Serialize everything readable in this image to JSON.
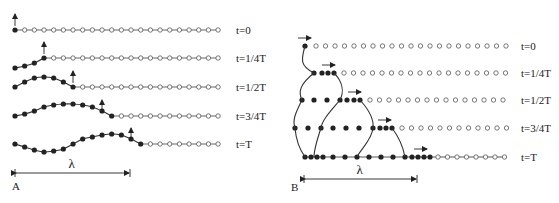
{
  "figure": {
    "panel_a": {
      "label": "A",
      "description": "Transverse wave propagation along a chain of particles",
      "n_points": 22,
      "x_start": 15,
      "spacing": 9.67,
      "rows": [
        {
          "time_label": "t=0",
          "y": 30,
          "displaced": [
            0
          ],
          "arrow_index": 0
        },
        {
          "time_label": "t=1/4T",
          "y": 58,
          "displaced": [
            -10,
            -8,
            -5,
            0
          ],
          "arrow_index": 3
        },
        {
          "time_label": "t=1/2T",
          "y": 87,
          "displaced": [
            0,
            5,
            9,
            10,
            9,
            5,
            0
          ],
          "arrow_index": 6
        },
        {
          "time_label": "t=3/4T",
          "y": 116,
          "displaced": [
            0,
            2,
            5,
            9,
            11,
            12,
            12,
            11,
            9,
            5,
            0
          ],
          "arrow_index": 9
        },
        {
          "time_label": "t=T",
          "y": 144,
          "displaced": [
            0,
            -3,
            -6,
            -8,
            -7,
            -5,
            0,
            5,
            7,
            9,
            10,
            9,
            5,
            0
          ],
          "arrow_index": 12
        }
      ],
      "wavelength_label": "λ",
      "wavelength_bar": {
        "x1": 15,
        "x2": 130,
        "y": 173
      }
    },
    "panel_b": {
      "label": "B",
      "description": "Longitudinal wave propagation along a chain of particles",
      "rows": [
        {
          "time_label": "t=0",
          "y": 46,
          "filled_x": [
            305
          ],
          "open_start": 316,
          "arrow_x": 298
        },
        {
          "time_label": "t=1/4T",
          "y": 73,
          "filled_x": [
            314,
            322,
            328,
            334
          ],
          "open_start": 344,
          "arrow_x": 322
        },
        {
          "time_label": "t=1/2T",
          "y": 100,
          "filled_x": [
            302,
            314,
            327,
            340,
            347,
            354,
            360
          ],
          "open_start": 370,
          "arrow_x": 348
        },
        {
          "time_label": "t=3/4T",
          "y": 128,
          "filled_x": [
            295,
            308,
            321,
            333,
            346,
            359,
            373,
            380,
            386,
            392
          ],
          "open_start": 402,
          "arrow_x": 378
        },
        {
          "time_label": "t=T",
          "y": 157,
          "filled_x": [
            305,
            311,
            317,
            323,
            333,
            345,
            357,
            369,
            381,
            393,
            405,
            412,
            418,
            424,
            430
          ],
          "open_start": 438,
          "arrow_x": 414
        }
      ],
      "open_spacing": 9.5,
      "open_end": 506,
      "wavelength_label": "λ",
      "wavelength_bar": {
        "x1": 304,
        "x2": 417,
        "y": 179
      }
    },
    "time_labels": [
      "t=0",
      "t=1/4T",
      "t=1/2T",
      "t=3/4T",
      "t=T"
    ],
    "colors": {
      "ink": "#222222",
      "line": "#333333",
      "background": "#ffffff"
    }
  }
}
